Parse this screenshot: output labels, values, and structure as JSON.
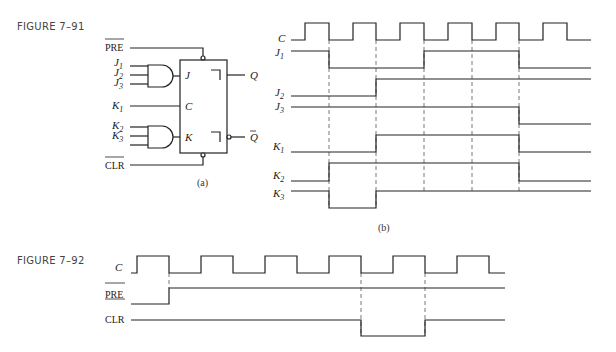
{
  "figure_91": {
    "label": "FIGURE 7–91",
    "part_a": {
      "caption": "(a)",
      "inputs": {
        "pre": "PRE",
        "clr": "CLR",
        "j1": "J",
        "j2": "J",
        "j3": "J",
        "k1": "K",
        "k2": "K",
        "k3": "K"
      },
      "subscripts": {
        "j1": "1",
        "j2": "2",
        "j3": "3",
        "k1": "1",
        "k2": "2",
        "k3": "3"
      },
      "flipflop_pins": {
        "j": "J",
        "c": "C",
        "k": "K"
      },
      "outputs": {
        "q": "Q",
        "qbar": "Q"
      }
    },
    "part_b": {
      "caption": "(b)",
      "signals": [
        "C",
        "J1",
        "J2",
        "J3",
        "K1",
        "K2",
        "K3"
      ],
      "signal_labels": {
        "c": "C",
        "j1": "J",
        "j2": "J",
        "j3": "J",
        "k1": "K",
        "k2": "K",
        "k3": "K"
      },
      "subscripts": {
        "j1": "1",
        "j2": "2",
        "j3": "3",
        "k1": "1",
        "k2": "2",
        "k3": "3"
      }
    }
  },
  "figure_92": {
    "label": "FIGURE 7–92",
    "signal_labels": {
      "c": "C",
      "pre": "PRE",
      "clr": "CLR"
    }
  }
}
